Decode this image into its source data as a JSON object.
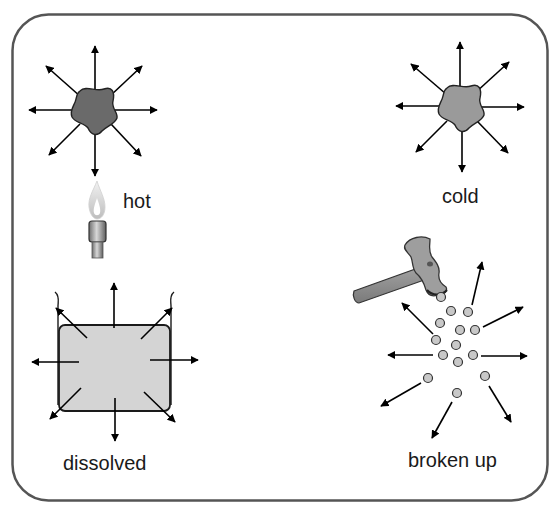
{
  "panels": [
    {
      "id": "hot",
      "label": "hot",
      "object": "blob",
      "source": "bunsen-burner-flame",
      "blob_color": "#6a6a6a"
    },
    {
      "id": "cold",
      "label": "cold",
      "object": "blob",
      "source": "none",
      "blob_color": "#9a9a9a"
    },
    {
      "id": "dissolved",
      "label": "dissolved",
      "object": "beaker-with-liquid",
      "liquid_color": "#d4d4d4"
    },
    {
      "id": "broken-up",
      "label": "broken up",
      "object": "particles",
      "source": "hammer",
      "particle_color": "#c8c8c8",
      "particle_count": 14
    }
  ],
  "colors": {
    "frame": "#555555",
    "arrow": "#000000",
    "text": "#1a1a1a",
    "background": "#ffffff"
  }
}
